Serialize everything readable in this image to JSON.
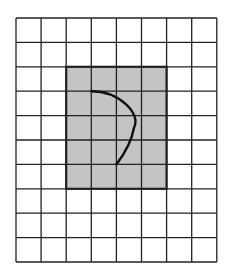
{
  "diagram": {
    "type": "grid-figure",
    "grid": {
      "columns": 8,
      "rows": 10,
      "origin_px": [
        16,
        18
      ],
      "cell_w": 25.1,
      "cell_h": 24.4
    },
    "shaded_rect": {
      "col_start": 2,
      "row_start": 2,
      "col_end": 6,
      "row_end": 7,
      "fill": "#c4c4c4"
    },
    "curve": {
      "description": "Arc from grid point (3,3) bulging right to about (4.7,4.5) and ending at grid point (4,6)",
      "start": [
        3,
        3
      ],
      "control1": [
        4.1,
        3.0
      ],
      "control2": [
        5.0,
        3.9
      ],
      "mid": [
        4.7,
        4.5
      ],
      "control3": [
        4.6,
        5.1
      ],
      "control4": [
        4.3,
        5.6
      ],
      "end": [
        4,
        6
      ]
    },
    "colors": {
      "line": "#222222",
      "background": "#ffffff",
      "shade": "#c4c4c4"
    }
  }
}
